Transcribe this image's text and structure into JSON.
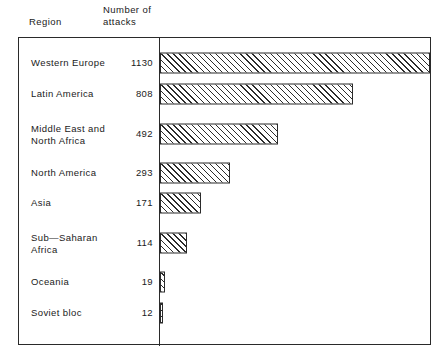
{
  "headers": {
    "region": "Region",
    "count": "Number of\nattacks"
  },
  "chart_data": {
    "type": "bar",
    "orientation": "horizontal",
    "title": "",
    "subtitle": "",
    "xlabel": "",
    "ylabel": "Region",
    "value_label": "Number of attacks",
    "grid": false,
    "legend": false,
    "axis_baseline_at": 0,
    "xlim": [
      0,
      1130
    ],
    "categories": [
      "Western Europe",
      "Latin America",
      "Middle East and\nNorth Africa",
      "North America",
      "Asia",
      "Sub—Saharan\nAfrica",
      "Oceania",
      "Soviet bloc"
    ],
    "values": [
      1130,
      808,
      492,
      293,
      171,
      114,
      19,
      12
    ],
    "value_labels": [
      "1130",
      "808",
      "492",
      "293",
      "171",
      "114",
      "19",
      "12"
    ],
    "bar_style": {
      "fill": "diagonal-hatch",
      "hatch_angle_deg": 45,
      "edge_color": "#2b2b2b",
      "face_color": "#ffffff"
    },
    "frame_color": "#2a2a2a"
  }
}
